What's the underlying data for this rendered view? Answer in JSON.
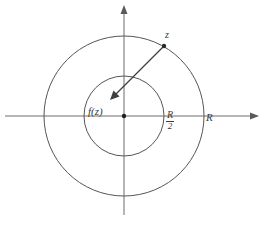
{
  "figure": {
    "caption": "",
    "background_color": "#ffffff",
    "stroke_color": "#4a4a4a",
    "label_color": "#3b3b3b",
    "width": 266,
    "height": 226
  },
  "axes": {
    "horizontal": {
      "name": "real-axis",
      "x_start": 5,
      "x_end": 259,
      "y": 116,
      "arrow": "right"
    },
    "vertical": {
      "name": "imaginary-axis",
      "x": 124,
      "y_start": 5,
      "y_end": 215,
      "arrow": "up"
    }
  },
  "origin": {
    "x": 124,
    "y": 116,
    "marker": "filled-dot"
  },
  "circles": [
    {
      "name": "outer-circle",
      "cx": 124,
      "cy": 116,
      "r": 80,
      "label": "R"
    },
    {
      "name": "inner-circle",
      "cx": 124,
      "cy": 116,
      "r": 40,
      "label_numerator": "R",
      "label_denominator": "2"
    }
  ],
  "points": [
    {
      "name": "point-z",
      "label": "z",
      "x": 164,
      "y": 46,
      "marker": "filled-dot"
    }
  ],
  "arrow": {
    "name": "z-to-fz-arrow",
    "from_x": 164,
    "from_y": 46,
    "to_x": 110,
    "to_y": 100,
    "head": "at-end"
  },
  "labels": {
    "z": "z",
    "fz": "f(z)",
    "R": "R",
    "R_half_numerator": "R",
    "R_half_denominator": "2"
  }
}
